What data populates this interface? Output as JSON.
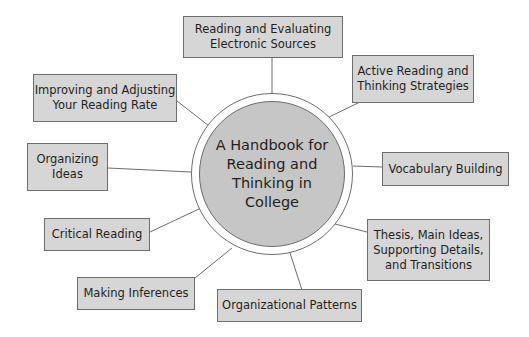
{
  "diagram": {
    "center": {
      "label": "A Handbook for\nReading and\nThinking in\nCollege"
    },
    "nodes": [
      {
        "id": "electronic-sources",
        "label": "Reading and Evaluating\nElectronic Sources"
      },
      {
        "id": "active-reading",
        "label": "Active Reading and\nThinking Strategies"
      },
      {
        "id": "vocabulary",
        "label": "Vocabulary Building"
      },
      {
        "id": "thesis",
        "label": "Thesis, Main Ideas,\nSupporting Details,\nand Transitions"
      },
      {
        "id": "patterns",
        "label": "Organizational Patterns"
      },
      {
        "id": "inferences",
        "label": "Making Inferences"
      },
      {
        "id": "critical",
        "label": "Critical Reading"
      },
      {
        "id": "organizing",
        "label": "Organizing\nIdeas"
      },
      {
        "id": "reading-rate",
        "label": "Improving and Adjusting\nYour Reading Rate"
      }
    ],
    "colors": {
      "node_fill": "#d6d6d6",
      "center_fill": "#c6c6c6",
      "stroke": "#6d6d6d"
    }
  }
}
